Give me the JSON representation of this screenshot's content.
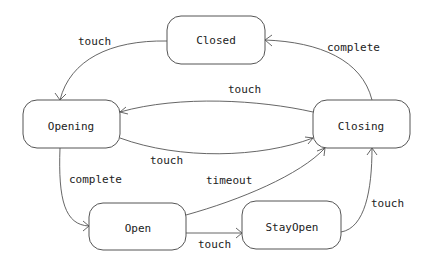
{
  "diagram": {
    "type": "state-machine",
    "nodes": [
      {
        "id": "closed",
        "label": "Closed"
      },
      {
        "id": "opening",
        "label": "Opening"
      },
      {
        "id": "closing",
        "label": "Closing"
      },
      {
        "id": "open",
        "label": "Open"
      },
      {
        "id": "stayopen",
        "label": "StayOpen"
      }
    ],
    "edges": [
      {
        "from": "closed",
        "to": "opening",
        "label": "touch"
      },
      {
        "from": "closing",
        "to": "closed",
        "label": "complete"
      },
      {
        "from": "closing",
        "to": "opening",
        "label": "touch"
      },
      {
        "from": "opening",
        "to": "closing",
        "label": "touch"
      },
      {
        "from": "opening",
        "to": "open",
        "label": "complete"
      },
      {
        "from": "open",
        "to": "closing",
        "label": "timeout"
      },
      {
        "from": "open",
        "to": "stayopen",
        "label": "touch"
      },
      {
        "from": "stayopen",
        "to": "closing",
        "label": "touch"
      }
    ]
  }
}
